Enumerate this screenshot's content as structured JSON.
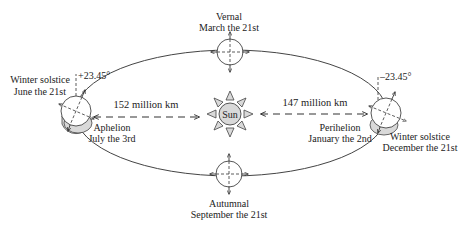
{
  "diagram": {
    "sun": {
      "label": "Sun"
    },
    "positions": {
      "vernal": {
        "line1": "Vernal",
        "line2": "March the 21st"
      },
      "autumnal": {
        "line1": "Autumnal",
        "line2": "September the 21st"
      },
      "left_solstice": {
        "line1": "Winter solstice",
        "line2": "June the 21st",
        "tilt": "+23.45°"
      },
      "aphelion": {
        "line1": "Aphelion",
        "line2": "July the 3rd"
      },
      "right_solstice": {
        "line1": "Winter solstice",
        "line2": "December the 21st",
        "tilt": "–23.45°"
      },
      "perihelion": {
        "line1": "Perihelion",
        "line2": "January the 2nd"
      }
    },
    "distances": {
      "aphelion_distance": "152 million km",
      "perihelion_distance": "147 million km"
    },
    "colors": {
      "line": "#333333",
      "sun_fill": "#d9d9d9",
      "shadow_fill": "#d9d9d9",
      "background": "#ffffff"
    }
  }
}
